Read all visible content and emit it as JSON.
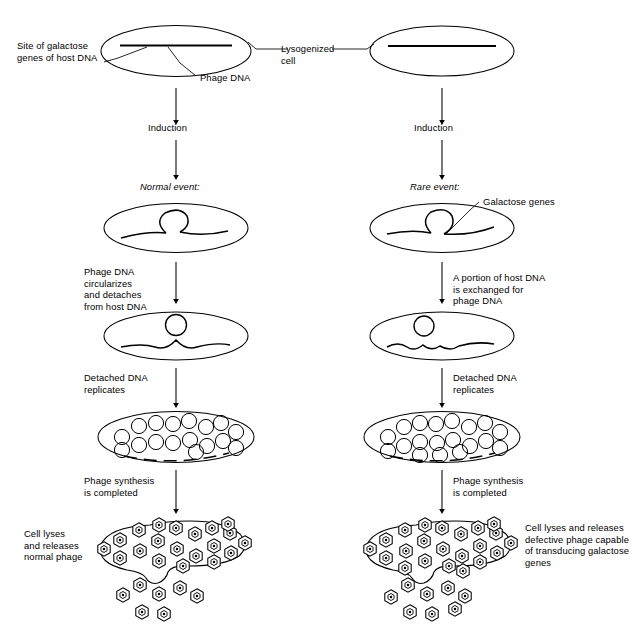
{
  "figure": {
    "type": "biology-process-diagram",
    "background_color": "#ffffff",
    "line_color": "#000000",
    "text_color": "#000000"
  },
  "labels": {
    "site_of_galactose_genes": "Site of galactose\ngenes of host DNA",
    "phage_dna": "Phage DNA",
    "lysogenized_cell": "Lysogenized\ncell",
    "induction_left": "Induction",
    "induction_right": "Induction",
    "normal_event": "Normal event:",
    "rare_event": "Rare event:",
    "galactose_genes": "Galactose genes",
    "phage_dna_circularizes": "Phage DNA\ncircularizes\nand detaches\nfrom host DNA",
    "portion_exchanged": "A portion of host DNA\nis exchanged for\nphage DNA",
    "detached_replicates_left": "Detached DNA\nreplicates",
    "detached_replicates_right": "Detached DNA\nreplicates",
    "phage_synthesis_left": "Phage synthesis\nis completed",
    "phage_synthesis_right": "Phage synthesis\nis completed",
    "cell_lyses_normal": "Cell lyses\nand releases\nnormal phage",
    "cell_lyses_defective": "Cell lyses and releases\ndefective phage capable\nof transducing galactose\ngenes"
  },
  "columns": {
    "left": {
      "name": "normal-event-pathway",
      "stages": [
        "lysogenized-cell-with-integrated-phage-dna",
        "phage-dna-loops-out",
        "phage-dna-detached-circle",
        "replicated-phage-dna-circles",
        "completed-phages-cell-lysing"
      ]
    },
    "right": {
      "name": "rare-event-pathway",
      "stages": [
        "lysogenized-cell-with-integrated-phage-dna",
        "phage-dna-loops-out-with-galactose-genes",
        "phage-dna-detached-circle-with-host-genes",
        "replicated-phage-dna-circles",
        "completed-defective-phages-cell-lysing"
      ]
    }
  },
  "counts": {
    "left_replication_circles": 17,
    "right_replication_circles": 19,
    "left_phages_inside": 20,
    "left_phages_released": 7,
    "right_phages_inside": 22,
    "right_phages_released": 8
  },
  "icons": {
    "phage_particle": "hexagon-phage-icon",
    "dna_circle": "circle-dna-icon",
    "cell_outline": "ellipse-cell-icon",
    "arrow": "down-arrow-icon"
  }
}
